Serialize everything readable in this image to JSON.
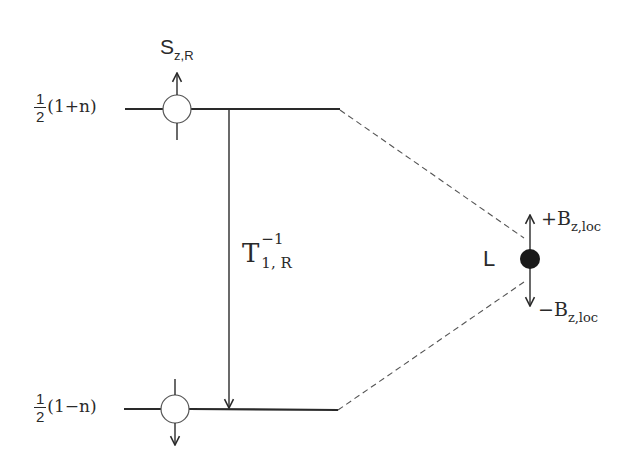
{
  "diagram": {
    "type": "energy-level-diagram",
    "levels": {
      "upper": {
        "label_fraction_num": "1",
        "label_fraction_den": "2",
        "label_expr": "(1+n)"
      },
      "lower": {
        "label_fraction_num": "1",
        "label_fraction_den": "2",
        "label_expr": "(1−n)"
      }
    },
    "spin": {
      "symbol": "S",
      "subscript": "z,R"
    },
    "transition": {
      "symbol": "T",
      "superscript": "−1",
      "subscript": "1, R"
    },
    "local": {
      "label": "L",
      "plus_field_sign": "+B",
      "plus_field_subscript": "z,loc",
      "minus_field_sign": "−B",
      "minus_field_subscript": "z,loc"
    },
    "colors": {
      "line": "#2a2a2a",
      "dot": "#1a1a1a",
      "background": "#ffffff"
    }
  }
}
